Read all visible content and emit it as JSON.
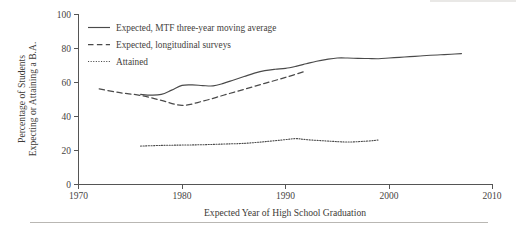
{
  "chart_data": {
    "type": "line",
    "title": "",
    "xlabel": "Expected Year of High School Graduation",
    "ylabel": "Percentage of Students Expecting or Attaining a B.A.",
    "ylabel_line1": "Percentage of Students",
    "ylabel_line2": "Expecting or Attaining a B.A.",
    "xlim": [
      1970,
      2010
    ],
    "ylim": [
      0,
      100
    ],
    "xticks": [
      1970,
      1980,
      1990,
      2000,
      2010
    ],
    "yticks": [
      0,
      20,
      40,
      60,
      80,
      100
    ],
    "xtick_labels": [
      "1970",
      "1980",
      "1990",
      "2000",
      "2010"
    ],
    "ytick_labels": [
      "0",
      "20",
      "40",
      "60",
      "80",
      "100"
    ],
    "grid": false,
    "legend_position": "upper-left-inside",
    "line_color": "#4a4a4a",
    "series": [
      {
        "name": "Expected, MTF three-year moving average",
        "style": "solid",
        "x": [
          1976,
          1977,
          1978,
          1979,
          1980,
          1981,
          1982,
          1983,
          1984,
          1985,
          1986,
          1987,
          1988,
          1989,
          1990,
          1991,
          1992,
          1993,
          1994,
          1995,
          1996,
          1997,
          1998,
          1999,
          2000,
          2001,
          2002,
          2003,
          2004,
          2005,
          2006,
          2007
        ],
        "values": [
          53.0,
          52.6,
          53.0,
          55.5,
          58.3,
          58.6,
          58.2,
          58.0,
          59.5,
          61.5,
          63.5,
          65.5,
          67.0,
          67.8,
          68.3,
          69.5,
          71.0,
          72.5,
          73.6,
          74.4,
          74.4,
          74.2,
          74.1,
          74.0,
          74.4,
          74.8,
          75.2,
          75.6,
          76.0,
          76.3,
          76.6,
          77.0
        ]
      },
      {
        "name": "Expected, longitudinal surveys",
        "style": "dashed",
        "x": [
          1972,
          1974,
          1976,
          1978,
          1980,
          1982,
          1984,
          1986,
          1988,
          1990,
          1992
        ],
        "values": [
          56.2,
          54.0,
          52.4,
          49.5,
          46.6,
          49.0,
          52.5,
          56.0,
          59.5,
          63.0,
          66.8
        ]
      },
      {
        "name": "Attained",
        "style": "dotted",
        "x": [
          1976,
          1978,
          1980,
          1982,
          1984,
          1986,
          1988,
          1990,
          1991,
          1992,
          1994,
          1996,
          1998,
          1999
        ],
        "values": [
          22.6,
          23.0,
          23.2,
          23.4,
          23.8,
          24.2,
          25.2,
          26.4,
          27.0,
          26.4,
          25.6,
          25.0,
          25.6,
          26.2
        ]
      }
    ]
  },
  "legend": {
    "items": [
      {
        "label": "Expected, MTF three-year moving average",
        "style": "solid"
      },
      {
        "label": "Expected, longitudinal surveys",
        "style": "dashed"
      },
      {
        "label": "Attained",
        "style": "dotted"
      }
    ]
  }
}
